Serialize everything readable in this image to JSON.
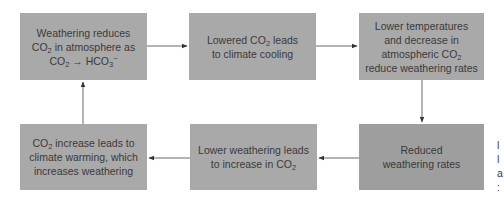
{
  "diagram": {
    "type": "flowchart-cycle",
    "nodes": [
      {
        "id": "n1",
        "lines": [
          "Weathering reduces",
          "CO2 in atmosphere as",
          "CO2 → HCO3−"
        ]
      },
      {
        "id": "n2",
        "lines": [
          "Lowered CO2 leads",
          "to climate cooling"
        ]
      },
      {
        "id": "n3",
        "lines": [
          "Lower temperatures",
          "and decrease in",
          "atmospheric CO2",
          "reduce weathering rates"
        ]
      },
      {
        "id": "n4",
        "lines": [
          "Reduced",
          "weathering rates"
        ]
      },
      {
        "id": "n5",
        "lines": [
          "Lower weathering leads",
          "to increase in CO2"
        ]
      },
      {
        "id": "n6",
        "lines": [
          "CO2 increase leads to",
          "climate warming, which",
          "increases weathering"
        ]
      }
    ],
    "edges": [
      {
        "from": "n1",
        "to": "n2"
      },
      {
        "from": "n2",
        "to": "n3"
      },
      {
        "from": "n3",
        "to": "n4"
      },
      {
        "from": "n4",
        "to": "n5"
      },
      {
        "from": "n5",
        "to": "n6"
      },
      {
        "from": "n6",
        "to": "n1"
      }
    ],
    "colors": {
      "box": "#a9a9a9",
      "box_dark": "#9e9e9e",
      "text": "#3a3a3a",
      "arrow": "#333333"
    },
    "cutoff_text_fragments": [
      "l",
      "l",
      "a",
      ":"
    ]
  }
}
